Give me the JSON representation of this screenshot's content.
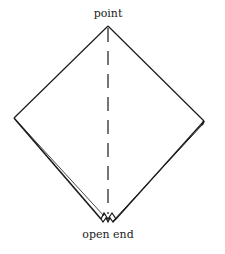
{
  "diagram": {
    "labels": {
      "top": "point",
      "bottom": "open end"
    },
    "shape": "diamond-folded-napkin",
    "fold_line": "dashed-vertical-center",
    "stroke_color": "#1a1a1a",
    "background": "#ffffff"
  }
}
